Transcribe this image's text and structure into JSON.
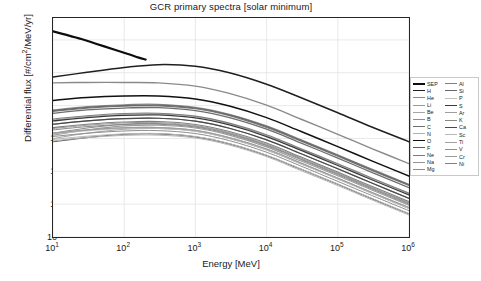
{
  "chart_data": {
    "type": "line",
    "title": "GCR primary spectra [solar minimum]",
    "xlabel": "Energy [MeV]",
    "ylabel_plain": "Differential flux [#/cm2/MeV/yr]",
    "xscale": "log",
    "yscale": "log",
    "xlim": [
      10,
      1000000
    ],
    "ylim": [
      1e-11,
      1000000000.0
    ],
    "grid": true,
    "legend_position": "right-outside",
    "xticks": [
      "10^1",
      "10^2",
      "10^3",
      "10^4",
      "10^5",
      "10^6"
    ],
    "xtick_mantissa": [
      "10",
      "10",
      "10",
      "10",
      "10",
      "10"
    ],
    "xtick_exponent": [
      "1",
      "2",
      "3",
      "4",
      "5",
      "6"
    ],
    "ytick_mantissa": [
      "10",
      "10",
      "10",
      "10",
      "10",
      "10",
      "10"
    ],
    "ytick_exponent": [
      "7",
      "4",
      "1",
      "-2",
      "-5",
      "-8",
      "-11"
    ],
    "series": [
      {
        "name": "SEP",
        "color": "#0d0d0d",
        "width": 2.2,
        "x": [
          10,
          15,
          25,
          40,
          70,
          110,
          160,
          200
        ],
        "y": [
          60000000.0,
          30000000.0,
          12000000.0,
          4500000.0,
          1400000.0,
          550000.0,
          240000.0,
          160000.0
        ]
      },
      {
        "name": "H",
        "color": "#1f1f1f",
        "width": 1.5,
        "x": [
          10,
          30,
          100,
          300,
          1000,
          3000,
          10000,
          30000,
          100000,
          300000,
          1000000
        ],
        "y": [
          4000.0,
          11000.0,
          30000.0,
          55000.0,
          40000.0,
          10000.0,
          900.0,
          55.0,
          2.2,
          0.11,
          0.005
        ]
      },
      {
        "name": "He",
        "color": "#8a8a8a",
        "width": 1.4,
        "x": [
          10,
          30,
          100,
          300,
          1000,
          3000,
          10000,
          30000,
          100000,
          300000,
          1000000
        ],
        "y": [
          1200.0,
          1300.0,
          1300.0,
          1200.0,
          600.0,
          130.0,
          11.0,
          0.6,
          0.024,
          0.0012,
          5e-05
        ]
      },
      {
        "name": "Li",
        "color": "#9a9a9a",
        "width": 1.1,
        "x": [
          10,
          30,
          100,
          300,
          1000,
          3000,
          10000,
          30000,
          100000,
          300000,
          1000000
        ],
        "y": [
          0.02,
          0.06,
          0.14,
          0.16,
          0.09,
          0.02,
          0.0017,
          9e-05,
          4e-06,
          2e-07,
          8e-09
        ]
      },
      {
        "name": "Be",
        "color": "#a6a6a6",
        "width": 1.1,
        "x": [
          10,
          30,
          100,
          300,
          1000,
          3000,
          10000,
          30000,
          100000,
          300000,
          1000000
        ],
        "y": [
          0.01,
          0.03,
          0.07,
          0.08,
          0.045,
          0.01,
          0.0009,
          5e-05,
          2e-06,
          1e-07,
          4e-09
        ]
      },
      {
        "name": "B",
        "color": "#8f8f8f",
        "width": 1.1,
        "x": [
          10,
          30,
          100,
          300,
          1000,
          3000,
          10000,
          30000,
          100000,
          300000,
          1000000
        ],
        "y": [
          0.03,
          0.09,
          0.2,
          0.23,
          0.13,
          0.03,
          0.0025,
          0.00014,
          6e-06,
          3e-07,
          1.2e-08
        ]
      },
      {
        "name": "C",
        "color": "#6e6e6e",
        "width": 1.3,
        "x": [
          10,
          30,
          100,
          300,
          1000,
          3000,
          10000,
          30000,
          100000,
          300000,
          1000000
        ],
        "y": [
          2.0,
          4.0,
          6.0,
          6.5,
          3.5,
          0.8,
          0.07,
          0.004,
          0.00016,
          8e-06,
          3.2e-07
        ]
      },
      {
        "name": "N",
        "color": "#b0b0b0",
        "width": 1.1,
        "x": [
          10,
          30,
          100,
          300,
          1000,
          3000,
          10000,
          30000,
          100000,
          300000,
          1000000
        ],
        "y": [
          0.5,
          1.0,
          1.6,
          1.8,
          1.0,
          0.22,
          0.019,
          0.0011,
          4.5e-05,
          2.2e-06,
          9e-08
        ]
      },
      {
        "name": "O",
        "color": "#111111",
        "width": 1.5,
        "x": [
          10,
          30,
          100,
          300,
          1000,
          3000,
          10000,
          30000,
          100000,
          300000,
          1000000
        ],
        "y": [
          30.0,
          55.0,
          75.0,
          75.0,
          40.0,
          9.0,
          0.8,
          0.045,
          0.0018,
          9e-05,
          3.6e-06
        ]
      },
      {
        "name": "F",
        "color": "#5c5c5c",
        "width": 1.1,
        "x": [
          10,
          30,
          100,
          300,
          1000,
          3000,
          10000,
          30000,
          100000,
          300000,
          1000000
        ],
        "y": [
          0.005,
          0.012,
          0.024,
          0.026,
          0.014,
          0.0032,
          0.00028,
          1.6e-05,
          6.5e-07,
          3.2e-08,
          1.3e-09
        ]
      },
      {
        "name": "Ne",
        "color": "#7a7a7a",
        "width": 1.2,
        "x": [
          10,
          30,
          100,
          300,
          1000,
          3000,
          10000,
          30000,
          100000,
          300000,
          1000000
        ],
        "y": [
          3.0,
          6.0,
          9.0,
          9.5,
          5.2,
          1.2,
          0.1,
          0.006,
          0.00024,
          1.2e-05,
          5e-07
        ]
      },
      {
        "name": "Na",
        "color": "#949494",
        "width": 1.1,
        "x": [
          10,
          30,
          100,
          300,
          1000,
          3000,
          10000,
          30000,
          100000,
          300000,
          1000000
        ],
        "y": [
          0.2,
          0.4,
          0.65,
          0.7,
          0.38,
          0.085,
          0.0075,
          0.00042,
          1.7e-05,
          8.5e-07,
          3.4e-08
        ]
      },
      {
        "name": "Mg",
        "color": "#8c8c8c",
        "width": 1.2,
        "x": [
          10,
          30,
          100,
          300,
          1000,
          3000,
          10000,
          30000,
          100000,
          300000,
          1000000
        ],
        "y": [
          4.0,
          8.0,
          12.0,
          13.0,
          7.0,
          1.6,
          0.14,
          0.008,
          0.00032,
          1.6e-05,
          6.4e-07
        ]
      },
      {
        "name": "Al",
        "color": "#7f7f7f",
        "width": 1.1,
        "x": [
          10,
          30,
          100,
          300,
          1000,
          3000,
          10000,
          30000,
          100000,
          300000,
          1000000
        ],
        "y": [
          0.6,
          1.2,
          1.9,
          2.0,
          1.1,
          0.25,
          0.022,
          0.0012,
          5e-05,
          2.5e-06,
          1e-07
        ]
      },
      {
        "name": "Si",
        "color": "#686868",
        "width": 1.2,
        "x": [
          10,
          30,
          100,
          300,
          1000,
          3000,
          10000,
          30000,
          100000,
          300000,
          1000000
        ],
        "y": [
          3.5,
          7.0,
          10.0,
          11.0,
          6.0,
          1.4,
          0.12,
          0.007,
          0.00028,
          1.4e-05,
          5.6e-07
        ]
      },
      {
        "name": "P",
        "color": "#c0c0c0",
        "width": 1.0,
        "x": [
          10,
          30,
          100,
          300,
          1000,
          3000,
          10000,
          30000,
          100000,
          300000,
          1000000
        ],
        "y": [
          0.025,
          0.05,
          0.08,
          0.085,
          0.046,
          0.01,
          0.0009,
          5e-05,
          2e-06,
          1e-07,
          4e-09
        ]
      },
      {
        "name": "S",
        "color": "#3a3a3a",
        "width": 1.3,
        "x": [
          10,
          30,
          100,
          300,
          1000,
          3000,
          10000,
          30000,
          100000,
          300000,
          1000000
        ],
        "y": [
          0.4,
          0.8,
          1.3,
          1.4,
          0.75,
          0.17,
          0.015,
          0.00085,
          3.4e-05,
          1.7e-06,
          7e-08
        ]
      },
      {
        "name": "Ar",
        "color": "#9e9e9e",
        "width": 1.0,
        "x": [
          10,
          30,
          100,
          300,
          1000,
          3000,
          10000,
          30000,
          100000,
          300000,
          1000000
        ],
        "y": [
          0.08,
          0.16,
          0.26,
          0.28,
          0.15,
          0.034,
          0.003,
          0.00017,
          7e-06,
          3.4e-07,
          1.4e-08
        ]
      },
      {
        "name": "K",
        "color": "#888888",
        "width": 1.0,
        "x": [
          10,
          30,
          100,
          300,
          1000,
          3000,
          10000,
          30000,
          100000,
          300000,
          1000000
        ],
        "y": [
          0.06,
          0.12,
          0.19,
          0.2,
          0.11,
          0.025,
          0.0022,
          0.00012,
          5e-06,
          2.5e-07,
          1e-08
        ]
      },
      {
        "name": "Ca",
        "color": "#4a4a4a",
        "width": 1.2,
        "x": [
          10,
          30,
          100,
          300,
          1000,
          3000,
          10000,
          30000,
          100000,
          300000,
          1000000
        ],
        "y": [
          0.2,
          0.4,
          0.65,
          0.7,
          0.38,
          0.085,
          0.0075,
          0.00042,
          1.7e-05,
          8.5e-07,
          3.4e-08
        ]
      },
      {
        "name": "Sc",
        "color": "#b8b8b8",
        "width": 1.0,
        "x": [
          10,
          30,
          100,
          300,
          1000,
          3000,
          10000,
          30000,
          100000,
          300000,
          1000000
        ],
        "y": [
          0.008,
          0.016,
          0.026,
          0.028,
          0.015,
          0.0034,
          0.0003,
          1.7e-05,
          7e-07,
          3.4e-08,
          1.4e-09
        ]
      },
      {
        "name": "Ti",
        "color": "#a0a0a0",
        "width": 1.0,
        "x": [
          10,
          30,
          100,
          300,
          1000,
          3000,
          10000,
          30000,
          100000,
          300000,
          1000000
        ],
        "y": [
          0.03,
          0.06,
          0.095,
          0.1,
          0.055,
          0.012,
          0.0011,
          6e-05,
          2.4e-06,
          1.2e-07,
          5e-09
        ]
      },
      {
        "name": "V",
        "color": "#909090",
        "width": 1.0,
        "x": [
          10,
          30,
          100,
          300,
          1000,
          3000,
          10000,
          30000,
          100000,
          300000,
          1000000
        ],
        "y": [
          0.015,
          0.03,
          0.048,
          0.052,
          0.028,
          0.0063,
          0.00055,
          3.1e-05,
          1.2e-06,
          6.2e-08,
          2.5e-09
        ]
      },
      {
        "name": "Cr",
        "color": "#9c9c9c",
        "width": 1.0,
        "x": [
          10,
          30,
          100,
          300,
          1000,
          3000,
          10000,
          30000,
          100000,
          300000,
          1000000
        ],
        "y": [
          0.03,
          0.06,
          0.095,
          0.1,
          0.055,
          0.012,
          0.0011,
          6e-05,
          2.4e-06,
          1.2e-07,
          5e-09
        ]
      },
      {
        "name": "Ni",
        "color": "#808080",
        "width": 1.1,
        "x": [
          10,
          30,
          100,
          300,
          1000,
          3000,
          10000,
          30000,
          100000,
          300000,
          1000000
        ],
        "y": [
          0.1,
          0.2,
          0.32,
          0.35,
          0.19,
          0.043,
          0.0038,
          0.00021,
          8.5e-06,
          4.3e-07,
          1.7e-08
        ]
      },
      {
        "name": "Fe-low",
        "color": "#b4b4b4",
        "width": 1.0,
        "hidden_from_legend": true,
        "x": [
          10,
          30,
          100,
          300,
          1000,
          3000,
          10000,
          30000,
          100000,
          300000,
          1000000
        ],
        "y": [
          0.006,
          0.012,
          0.019,
          0.02,
          0.011,
          0.0025,
          0.00022,
          1.2e-05,
          5e-07,
          2.5e-08,
          1e-09
        ]
      }
    ]
  },
  "legend": {
    "columns": [
      [
        "SEP",
        "H",
        "He",
        "Li",
        "Be",
        "B",
        "C",
        "N",
        "O",
        "F",
        "Ne",
        "Na",
        "Mg"
      ],
      [
        "Al",
        "Si",
        "P",
        "S",
        "Ar",
        "K",
        "Ca",
        "Sc",
        "Ti",
        "V",
        "Cr",
        "Ni"
      ]
    ]
  },
  "axes": {
    "ylabel_prefix": "Differential flux [#/cm",
    "ylabel_sup": "2",
    "ylabel_suffix": "/MeV/yr]"
  }
}
